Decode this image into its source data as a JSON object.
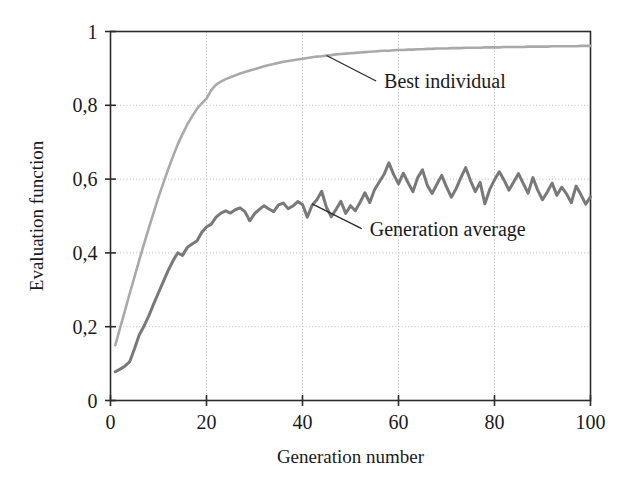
{
  "chart_data": {
    "type": "line",
    "title": "",
    "xlabel": "Generation number",
    "ylabel": "Evaluation function",
    "xlim": [
      0,
      100
    ],
    "ylim": [
      0,
      1
    ],
    "grid": true,
    "legend_position": "inline-annotations",
    "x_ticks": [
      "0",
      "20",
      "40",
      "60",
      "80",
      "100"
    ],
    "x_tick_values": [
      0,
      20,
      40,
      60,
      80,
      100
    ],
    "y_ticks": [
      "0",
      "0,2",
      "0,4",
      "0,6",
      "0,8",
      "1"
    ],
    "y_tick_values": [
      0,
      0.2,
      0.4,
      0.6,
      0.8,
      1
    ],
    "decimal_separator": ",",
    "x": [
      1,
      2,
      3,
      4,
      5,
      6,
      7,
      8,
      9,
      10,
      11,
      12,
      13,
      14,
      15,
      16,
      17,
      18,
      19,
      20,
      21,
      22,
      23,
      24,
      25,
      26,
      27,
      28,
      29,
      30,
      31,
      32,
      33,
      34,
      35,
      36,
      37,
      38,
      39,
      40,
      41,
      42,
      43,
      44,
      45,
      46,
      47,
      48,
      49,
      50,
      51,
      52,
      53,
      54,
      55,
      56,
      57,
      58,
      59,
      60,
      61,
      62,
      63,
      64,
      65,
      66,
      67,
      68,
      69,
      70,
      71,
      72,
      73,
      74,
      75,
      76,
      77,
      78,
      79,
      80,
      81,
      82,
      83,
      84,
      85,
      86,
      87,
      88,
      89,
      90,
      91,
      92,
      93,
      94,
      95,
      96,
      97,
      98,
      99,
      100
    ],
    "series": [
      {
        "name": "Best individual",
        "color": "#a9a9a9",
        "width": 2.6,
        "annotation": {
          "text": "Best individual",
          "anchor_x": 45,
          "anchor_y": 0.935,
          "text_x": 57,
          "text_y": 0.855
        },
        "values": [
          0.15,
          0.197,
          0.243,
          0.29,
          0.335,
          0.381,
          0.425,
          0.468,
          0.51,
          0.551,
          0.589,
          0.626,
          0.661,
          0.694,
          0.722,
          0.748,
          0.77,
          0.79,
          0.805,
          0.818,
          0.841,
          0.856,
          0.864,
          0.871,
          0.876,
          0.881,
          0.886,
          0.89,
          0.894,
          0.898,
          0.902,
          0.906,
          0.909,
          0.912,
          0.915,
          0.918,
          0.92,
          0.922,
          0.924,
          0.926,
          0.928,
          0.93,
          0.932,
          0.933,
          0.935,
          0.936,
          0.938,
          0.939,
          0.94,
          0.941,
          0.942,
          0.943,
          0.944,
          0.945,
          0.946,
          0.947,
          0.948,
          0.948,
          0.949,
          0.95,
          0.95,
          0.951,
          0.951,
          0.952,
          0.952,
          0.953,
          0.953,
          0.954,
          0.954,
          0.954,
          0.955,
          0.955,
          0.955,
          0.956,
          0.956,
          0.956,
          0.956,
          0.957,
          0.957,
          0.957,
          0.957,
          0.958,
          0.958,
          0.958,
          0.958,
          0.958,
          0.959,
          0.959,
          0.959,
          0.959,
          0.959,
          0.96,
          0.96,
          0.96,
          0.96,
          0.96,
          0.96,
          0.961,
          0.961,
          0.961
        ]
      },
      {
        "name": "Generation average",
        "color": "#797979",
        "width": 3.0,
        "annotation": {
          "text": "Generation average",
          "anchor_x": 42,
          "anchor_y": 0.533,
          "text_x": 54,
          "text_y": 0.455
        },
        "values": [
          0.078,
          0.085,
          0.093,
          0.105,
          0.14,
          0.178,
          0.202,
          0.23,
          0.262,
          0.292,
          0.322,
          0.352,
          0.378,
          0.4,
          0.393,
          0.415,
          0.424,
          0.432,
          0.455,
          0.47,
          0.478,
          0.497,
          0.508,
          0.514,
          0.508,
          0.517,
          0.522,
          0.512,
          0.487,
          0.506,
          0.518,
          0.528,
          0.519,
          0.512,
          0.53,
          0.535,
          0.52,
          0.527,
          0.539,
          0.531,
          0.497,
          0.529,
          0.544,
          0.567,
          0.523,
          0.498,
          0.518,
          0.54,
          0.507,
          0.528,
          0.514,
          0.537,
          0.563,
          0.536,
          0.571,
          0.592,
          0.613,
          0.644,
          0.612,
          0.587,
          0.616,
          0.59,
          0.566,
          0.604,
          0.625,
          0.583,
          0.561,
          0.586,
          0.61,
          0.579,
          0.551,
          0.574,
          0.604,
          0.631,
          0.596,
          0.566,
          0.591,
          0.533,
          0.572,
          0.598,
          0.62,
          0.597,
          0.57,
          0.592,
          0.615,
          0.588,
          0.562,
          0.604,
          0.57,
          0.544,
          0.565,
          0.589,
          0.556,
          0.578,
          0.56,
          0.536,
          0.581,
          0.558,
          0.532,
          0.552
        ]
      }
    ]
  },
  "axes": {
    "x_axis_title": "Generation number",
    "y_axis_title": "Evaluation function"
  },
  "colors": {
    "best_individual": "#a9a9a9",
    "generation_average": "#797979",
    "axis": "#2b2b2b",
    "grid": "#b8b8b8",
    "text": "#1a1a1a",
    "background": "#ffffff"
  }
}
